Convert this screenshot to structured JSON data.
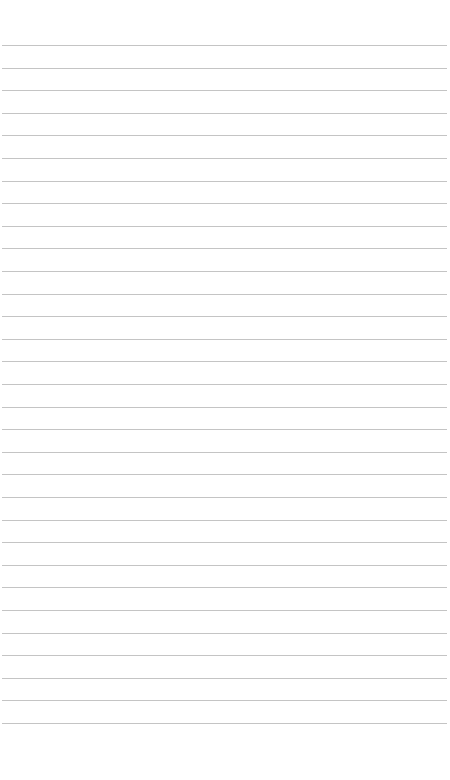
{
  "page": {
    "type": "lined-paper",
    "background_color": "#ffffff",
    "line_color": "#c4c4c4",
    "line_count": 31,
    "first_line_y": 45,
    "line_spacing": 22.6,
    "line_left": 2,
    "line_right": 447
  }
}
